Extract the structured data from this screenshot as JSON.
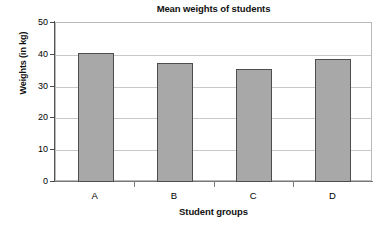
{
  "chart_data": {
    "type": "bar",
    "title": "Mean weights of students",
    "xlabel": "Student groups",
    "ylabel": "Weights (in kg)",
    "categories": [
      "A",
      "B",
      "C",
      "D"
    ],
    "values": [
      40.7,
      37.4,
      35.5,
      38.7
    ],
    "ylim": [
      0,
      50
    ],
    "ytick_labels": [
      "0",
      "10",
      "20",
      "30",
      "40",
      "50"
    ],
    "ytick_values": [
      0,
      10,
      20,
      30,
      40,
      50
    ],
    "grid": true,
    "legend": false,
    "legend_position": "none",
    "series": [
      {
        "name": "Mean weight",
        "values": [
          40.7,
          37.4,
          35.5,
          38.7
        ]
      }
    ]
  },
  "style": {
    "bar_fill": "#a8a8a8",
    "bar_border": "#4d4d4d",
    "gridline_color": "#c9c9c9",
    "plot_border": "#b9b9b9",
    "axis_color": "#555555",
    "text_color": "#000000",
    "background": "#ffffff"
  }
}
